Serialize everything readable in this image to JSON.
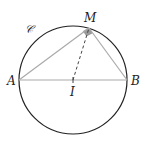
{
  "figure": {
    "width": 143,
    "height": 146,
    "colors": {
      "circle": "#222222",
      "segments": "#aaaaaa",
      "dashed": "#444444",
      "right_angle_fill": "#9a9a9a",
      "label": "#222222"
    },
    "circle": {
      "label": "𝒞",
      "cx": 73,
      "cy": 80,
      "r": 54
    },
    "points": {
      "A": {
        "label": "A",
        "x": 19,
        "y": 80
      },
      "B": {
        "label": "B",
        "x": 127,
        "y": 80
      },
      "I": {
        "label": "I",
        "x": 73,
        "y": 80
      },
      "M": {
        "label": "M",
        "x": 89,
        "y": 28
      }
    },
    "segments": [
      {
        "from": "A",
        "to": "B",
        "style": "solid"
      },
      {
        "from": "A",
        "to": "M",
        "style": "solid"
      },
      {
        "from": "M",
        "to": "B",
        "style": "solid"
      },
      {
        "from": "I",
        "to": "M",
        "style": "dashed"
      }
    ],
    "marks": {
      "right_angle_at": "M",
      "tick_at": "I"
    }
  }
}
